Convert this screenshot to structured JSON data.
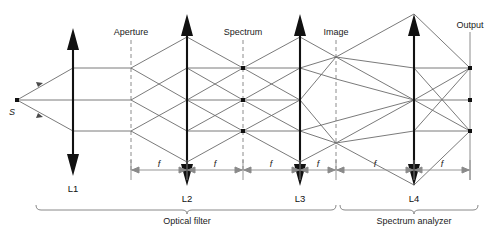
{
  "figure": {
    "source_label": "S",
    "plane_labels": [
      {
        "name": "aperture",
        "text": "Aperture",
        "x": 131,
        "style": "dashed"
      },
      {
        "name": "spectrum",
        "text": "Spectrum",
        "x": 243,
        "style": "dashed"
      },
      {
        "name": "image",
        "text": "Image",
        "x": 336,
        "style": "dashed"
      },
      {
        "name": "output",
        "text": "Output",
        "x": 470,
        "style": "solid"
      }
    ],
    "lenses": [
      {
        "name": "L1",
        "text": "L1",
        "x": 73
      },
      {
        "name": "L2",
        "text": "L2",
        "x": 187
      },
      {
        "name": "L3",
        "text": "L3",
        "x": 300
      },
      {
        "name": "L4",
        "text": "L4",
        "x": 414
      }
    ],
    "focal_label": "f",
    "focal_segments": [
      {
        "from": 131,
        "to": 187
      },
      {
        "from": 187,
        "to": 243
      },
      {
        "from": 243,
        "to": 300
      },
      {
        "from": 300,
        "to": 336
      },
      {
        "from": 336,
        "to": 414
      },
      {
        "from": 414,
        "to": 470
      }
    ],
    "brackets": [
      {
        "name": "optical-filter",
        "text": "Optical filter",
        "from": 36,
        "to": 336
      },
      {
        "name": "spectrum-analyzer",
        "text": "Spectrum analyzer",
        "from": 340,
        "to": 478
      }
    ],
    "ray_heights": [
      68,
      100,
      131
    ],
    "axis_y": 100,
    "colors": {
      "ray": "#6b6b6b",
      "lens": "#111111",
      "plane_dashed": "#8c8c8c",
      "plane_solid": "#8c8c8c",
      "node": "#111111",
      "text": "#1a1a1a",
      "bracket": "#7a7a7a",
      "background": "#ffffff"
    }
  }
}
